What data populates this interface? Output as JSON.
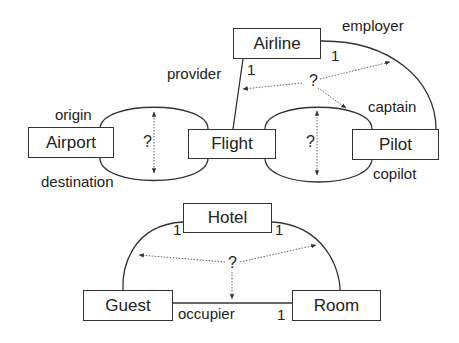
{
  "diagram": {
    "entities": {
      "airline": "Airline",
      "flight": "Flight",
      "airport": "Airport",
      "pilot": "Pilot",
      "hotel": "Hotel",
      "guest": "Guest",
      "room": "Room"
    },
    "roles": {
      "origin": "origin",
      "destination": "destination",
      "provider": "provider",
      "employer": "employer",
      "captain": "captain",
      "copilot": "copilot",
      "occupier": "occupier"
    },
    "cardinalities": {
      "provider_one": "1",
      "employer_one": "1",
      "hotel_guest_one": "1",
      "hotel_room_one": "1",
      "occupier_one": "1"
    },
    "question_marks": {
      "airport_flight": "?",
      "flight_pilot": "?",
      "airline_triangle": "?",
      "hotel_triangle": "?"
    }
  }
}
